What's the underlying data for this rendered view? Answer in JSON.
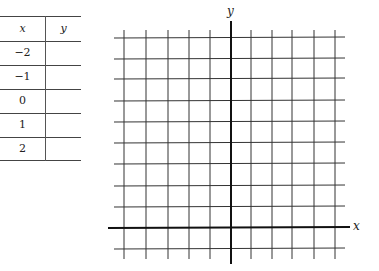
{
  "table": {
    "headers": [
      "x",
      "y"
    ],
    "rows": [
      {
        "x": "−2",
        "y": ""
      },
      {
        "x": "−1",
        "y": ""
      },
      {
        "x": "0",
        "y": ""
      },
      {
        "x": "1",
        "y": ""
      },
      {
        "x": "2",
        "y": ""
      }
    ]
  },
  "graph": {
    "x_axis_label": "x",
    "y_axis_label": "y",
    "grid_columns": 10,
    "grid_rows": 10,
    "line_color": "#222222"
  }
}
